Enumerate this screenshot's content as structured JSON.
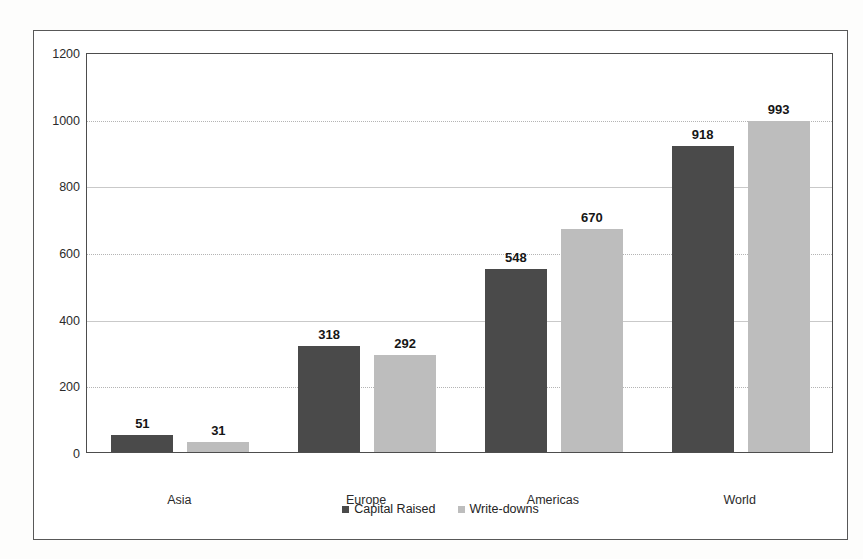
{
  "chart_data": {
    "type": "bar",
    "title": "",
    "xlabel": "",
    "ylabel": "",
    "categories": [
      "Asia",
      "Europe",
      "Americas",
      "World"
    ],
    "series": [
      {
        "name": "Capital Raised",
        "color": "#4a4a4a",
        "values": [
          51,
          318,
          548,
          918
        ]
      },
      {
        "name": "Write-downs",
        "color": "#bdbdbd",
        "values": [
          31,
          292,
          670,
          993
        ]
      }
    ],
    "ylim": [
      0,
      1200
    ],
    "ytick_step": 200,
    "yticks": [
      0,
      200,
      400,
      600,
      800,
      1000,
      1200
    ],
    "ytick_labels": [
      "0",
      "200",
      "400",
      "600",
      "800",
      "1000",
      "1200"
    ],
    "grid": true,
    "grid_axis": "y",
    "legend_position": "bottom",
    "data_labels": true,
    "plot_background": "#ffffff",
    "border_color": "#4d4d4d",
    "gridline_color": "#b4b4b4"
  }
}
